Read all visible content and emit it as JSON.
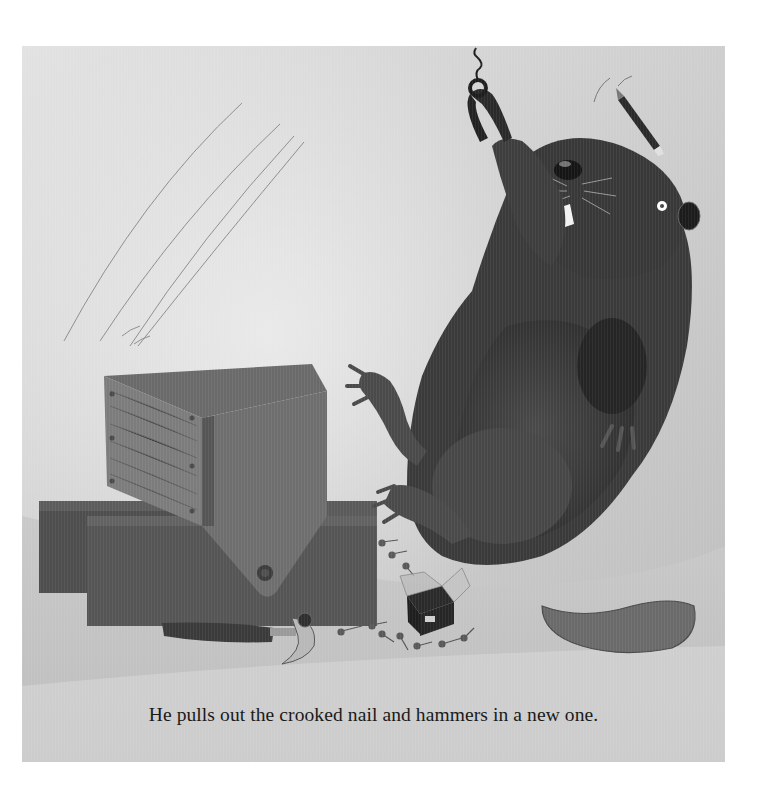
{
  "page": {
    "caption": "He pulls out the crooked nail and hammers in a new one.",
    "illustration": {
      "description": "Grayscale watercolor of a beaver leaning back, holding pliers with a pulled crooked nail aloft, a pencil flying above his head, beside a wooden box built on wooden blocks, with a claw hammer and scattered nails and an open nail box on the floor.",
      "elements": [
        {
          "name": "beaver",
          "icon": "beaver-figure"
        },
        {
          "name": "pliers",
          "icon": "pliers-icon"
        },
        {
          "name": "crooked-nail",
          "icon": "nail-icon"
        },
        {
          "name": "pencil",
          "icon": "pencil-icon"
        },
        {
          "name": "wooden-box",
          "icon": "box-icon"
        },
        {
          "name": "wooden-blocks",
          "icon": "block-icon"
        },
        {
          "name": "claw-hammer",
          "icon": "hammer-icon"
        },
        {
          "name": "nail-box",
          "icon": "nail-box-icon"
        },
        {
          "name": "scattered-nails",
          "icon": "nails-icon"
        }
      ]
    }
  },
  "colors": {
    "page_background": "#ffffff",
    "paper": "#d8d8d8",
    "wall_light": "#e6e6e6",
    "wall_shade": "#bdbdbd",
    "floor": "#c8c8c8",
    "beaver_fur": "#3c3c3c",
    "beaver_dark": "#2a2a2a",
    "wood": "#6e6e6e",
    "wood_dark": "#4a4a4a",
    "caption_text": "#1a1a1a"
  }
}
